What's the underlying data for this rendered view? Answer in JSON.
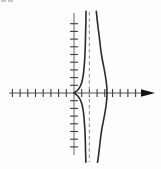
{
  "figure": {
    "background": "#fdfdfd",
    "corner_mark": {
      "description": "faint cropped print mark at top-left edge",
      "color": "#b8b4ae",
      "dashes_px": [
        [
          1,
          0,
          5,
          2
        ],
        [
          8,
          0,
          5,
          2
        ]
      ]
    }
  },
  "chart_data": {
    "type": "line",
    "axes": {
      "x_range_units": [
        -8.4,
        10.5
      ],
      "y_range_units": [
        -9.1,
        10.4
      ],
      "tick_step": 1,
      "tick_labels": false,
      "grid": false,
      "x_axis_arrow": "right",
      "x_ticks": [
        -8,
        -7,
        -6,
        -5,
        -4,
        -3,
        -2,
        -1,
        1,
        2,
        3,
        4,
        5,
        6,
        7,
        8
      ],
      "y_ticks": [
        -7,
        -6,
        -5,
        -4,
        -3,
        -2,
        -1,
        1,
        2,
        3,
        4,
        5,
        6,
        7,
        8,
        9
      ]
    },
    "asymptote": {
      "x": 2,
      "style": "dashed",
      "orientation": "vertical"
    },
    "features": {
      "cusp": [
        0,
        0
      ],
      "vertex": [
        4.29,
        0
      ],
      "x_intercepts": [
        0,
        4.29
      ],
      "symmetry": "about x-axis"
    },
    "series": [
      {
        "name": "inner branch",
        "points": [
          [
            1.54,
            -9.0
          ],
          [
            1.51,
            -7.8
          ],
          [
            1.48,
            -6.6
          ],
          [
            1.44,
            -5.4
          ],
          [
            1.38,
            -4.2
          ],
          [
            1.3,
            -3.2
          ],
          [
            1.2,
            -2.3
          ],
          [
            1.05,
            -1.55
          ],
          [
            0.85,
            -0.95
          ],
          [
            0.55,
            -0.45
          ],
          [
            0.25,
            -0.18
          ],
          [
            0.0,
            0.0
          ],
          [
            0.25,
            0.18
          ],
          [
            0.55,
            0.45
          ],
          [
            0.85,
            0.95
          ],
          [
            1.05,
            1.55
          ],
          [
            1.2,
            2.3
          ],
          [
            1.3,
            3.2
          ],
          [
            1.38,
            4.2
          ],
          [
            1.44,
            5.4
          ],
          [
            1.48,
            6.6
          ],
          [
            1.51,
            7.8
          ],
          [
            1.54,
            9.2
          ],
          [
            1.56,
            10.6
          ]
        ]
      },
      {
        "name": "outer branch",
        "points": [
          [
            3.05,
            -9.0
          ],
          [
            3.12,
            -8.6
          ],
          [
            3.25,
            -7.6
          ],
          [
            3.37,
            -6.6
          ],
          [
            3.47,
            -5.7
          ],
          [
            3.6,
            -4.8
          ],
          [
            3.76,
            -3.9
          ],
          [
            3.92,
            -3.1
          ],
          [
            4.06,
            -2.3
          ],
          [
            4.18,
            -1.5
          ],
          [
            4.26,
            -0.7
          ],
          [
            4.29,
            0.0
          ],
          [
            4.26,
            0.7
          ],
          [
            4.18,
            1.5
          ],
          [
            4.06,
            2.3
          ],
          [
            3.92,
            3.1
          ],
          [
            3.76,
            3.9
          ],
          [
            3.6,
            4.8
          ],
          [
            3.47,
            5.7
          ],
          [
            3.37,
            6.6
          ],
          [
            3.25,
            7.6
          ],
          [
            3.12,
            8.6
          ],
          [
            3.0,
            9.6
          ],
          [
            2.9,
            10.6
          ]
        ]
      }
    ],
    "plot": {
      "origin_px": [
        74,
        93
      ],
      "unit_px": 7.7,
      "x_axis_px": [
        9,
        147
      ],
      "arrow_tip_px": 155,
      "y_axis_px": [
        13,
        155
      ],
      "asymptote_y_px": [
        12,
        162
      ],
      "tick_half_px": 4
    },
    "colors": {
      "curve": "#2b2b2b",
      "axis": "#8a8a8a",
      "tick": "#3d3d3d",
      "asymptote": "#9b9b9b",
      "arrow": "#141414"
    }
  }
}
